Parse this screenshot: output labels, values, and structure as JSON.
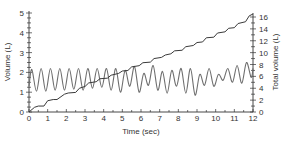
{
  "chart_data": {
    "type": "line",
    "title": "",
    "xlabel": "Time (sec)",
    "ylabel": "Volume (L)",
    "y2label": "Total volume (L)",
    "xlim": [
      0,
      12
    ],
    "ylim": [
      0,
      5
    ],
    "y2lim": [
      0,
      17
    ],
    "grid": false,
    "legend": "none",
    "x_ticks": [
      0,
      1,
      2,
      3,
      4,
      5,
      6,
      7,
      8,
      9,
      10,
      11,
      12
    ],
    "y_ticks": [
      0,
      1,
      2,
      3,
      4,
      5
    ],
    "y2_ticks": [
      0,
      2,
      4,
      6,
      8,
      10,
      12,
      14,
      16
    ],
    "series": [
      {
        "name": "Tidal volume",
        "axis": "left",
        "color": "#6e6e6e",
        "description": "Oscillating breathing trace, roughly sinusoidal, ~1.25 breaths per second",
        "x": [
          0.0,
          0.15,
          0.4,
          0.65,
          0.9,
          1.15,
          1.4,
          1.65,
          1.9,
          2.15,
          2.4,
          2.65,
          2.9,
          3.15,
          3.4,
          3.65,
          3.9,
          4.15,
          4.4,
          4.65,
          4.9,
          5.15,
          5.4,
          5.65,
          5.9,
          6.15,
          6.4,
          6.65,
          6.9,
          7.15,
          7.4,
          7.65,
          7.9,
          8.15,
          8.4,
          8.65,
          8.9,
          9.15,
          9.4,
          9.65,
          9.9,
          10.15,
          10.4,
          10.65,
          10.9,
          11.15,
          11.4,
          11.65,
          11.9,
          12.0
        ],
        "values": [
          1.3,
          2.15,
          1.05,
          2.2,
          1.05,
          2.2,
          1.1,
          2.2,
          1.1,
          2.2,
          1.15,
          2.2,
          1.1,
          2.2,
          1.2,
          2.2,
          1.25,
          2.2,
          1.1,
          2.2,
          1.0,
          2.1,
          1.3,
          2.3,
          1.0,
          1.95,
          1.35,
          2.35,
          1.1,
          2.05,
          0.95,
          2.1,
          1.3,
          2.2,
          0.95,
          2.2,
          0.85,
          1.9,
          1.35,
          2.2,
          1.3,
          1.9,
          1.6,
          2.2,
          1.5,
          2.35,
          1.45,
          2.5,
          1.75,
          2.2
        ]
      },
      {
        "name": "Total volume",
        "axis": "right",
        "color": "#3a3a3a",
        "description": "Cumulative volume rising in small steps from 0 to ~16.6 L over 12 s",
        "x": [
          0.0,
          0.3,
          0.5,
          0.8,
          1.0,
          1.3,
          1.5,
          1.9,
          2.1,
          2.5,
          2.7,
          3.0,
          3.2,
          3.6,
          3.8,
          4.2,
          4.4,
          4.8,
          5.0,
          5.3,
          5.5,
          5.9,
          6.1,
          6.5,
          6.7,
          7.1,
          7.3,
          7.6,
          7.8,
          8.2,
          8.4,
          8.8,
          9.0,
          9.3,
          9.5,
          9.9,
          10.1,
          10.5,
          10.7,
          11.0,
          11.2,
          11.6,
          11.8,
          12.0
        ],
        "values": [
          0.0,
          0.8,
          1.0,
          1.0,
          1.9,
          2.1,
          2.1,
          3.0,
          3.2,
          3.3,
          4.0,
          4.3,
          4.9,
          5.1,
          5.6,
          5.7,
          6.2,
          6.5,
          6.9,
          7.0,
          7.6,
          7.8,
          8.3,
          8.4,
          9.0,
          9.2,
          9.6,
          9.8,
          10.3,
          10.4,
          11.0,
          11.2,
          11.7,
          11.8,
          12.5,
          12.6,
          13.3,
          13.5,
          14.1,
          14.2,
          14.9,
          15.2,
          16.2,
          16.5
        ]
      }
    ]
  },
  "axes": {
    "x_title": "Time (sec)",
    "y_left_title": "Volume (L)",
    "y_right_title": "Total volume (L)",
    "x_tick_labels": [
      "0",
      "1",
      "2",
      "3",
      "4",
      "5",
      "6",
      "7",
      "8",
      "9",
      "10",
      "11",
      "12"
    ],
    "y_left_tick_labels": [
      "0",
      "1",
      "2",
      "3",
      "4",
      "5"
    ],
    "y_right_tick_labels": [
      "0",
      "2",
      "4",
      "6",
      "8",
      "10",
      "12",
      "14",
      "16"
    ]
  },
  "colors": {
    "axis": "#333333",
    "tidal_line": "#6e6e6e",
    "total_line": "#3a3a3a",
    "background": "#ffffff"
  }
}
